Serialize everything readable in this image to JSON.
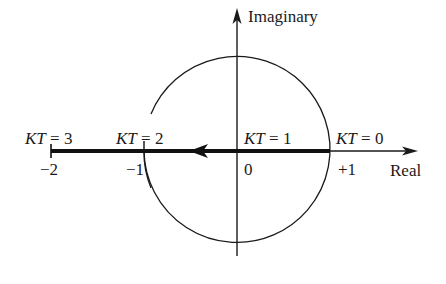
{
  "diagram": {
    "type": "root-locus-z-plane",
    "axes": {
      "vertical_label": "Imaginary",
      "horizontal_label": "Real"
    },
    "tick_labels": {
      "minus_two": "−2",
      "minus_one": "−1",
      "zero": "0",
      "plus_one": "+1"
    },
    "gain_labels": {
      "kt0": "KT = 0",
      "kt1": "KT = 1",
      "kt2": "KT = 2",
      "kt3": "KT = 3"
    },
    "unit_circle": {
      "center": [
        0,
        0
      ],
      "radius": 1
    },
    "locus": {
      "from_real": 1,
      "to_real": -2,
      "direction": "left",
      "gain_points": [
        {
          "kt": 0,
          "real": 1
        },
        {
          "kt": 1,
          "real": 0
        },
        {
          "kt": 2,
          "real": -1
        },
        {
          "kt": 3,
          "real": -2
        }
      ]
    },
    "colors": {
      "ink": "#1a1a1a",
      "background": "#ffffff"
    }
  }
}
